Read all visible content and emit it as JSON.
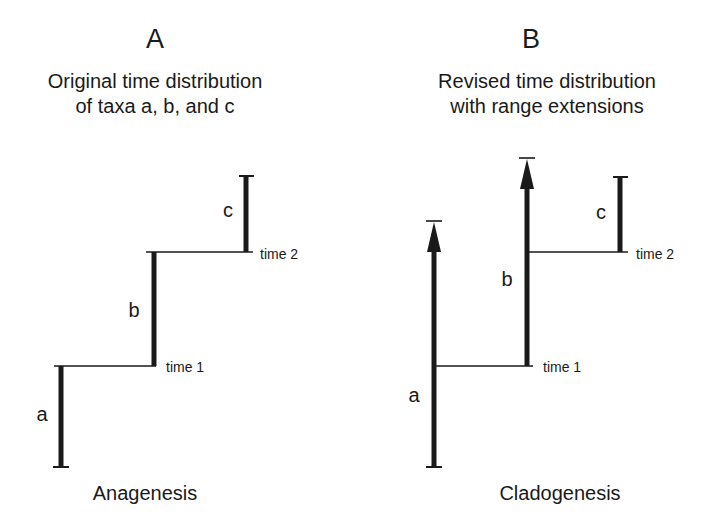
{
  "panels": [
    {
      "letter": "A",
      "title_line1": "Original time distribution",
      "title_line2": "of taxa a, b, and c",
      "caption": "Anagenesis",
      "taxa": {
        "a": "a",
        "b": "b",
        "c": "c"
      },
      "time_labels": {
        "t1": "time 1",
        "t2": "time 2"
      }
    },
    {
      "letter": "B",
      "title_line1": "Revised time distribution",
      "title_line2": "with range extensions",
      "caption": "Cladogenesis",
      "taxa": {
        "a": "a",
        "b": "b",
        "c": "c"
      },
      "time_labels": {
        "t1": "time 1",
        "t2": "time 2"
      }
    }
  ],
  "colors": {
    "ink": "#1a1a1a",
    "background": "#ffffff"
  }
}
